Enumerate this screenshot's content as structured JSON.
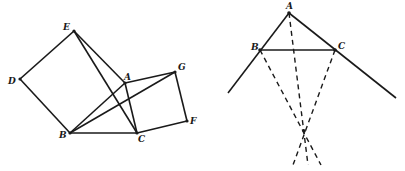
{
  "figures": {
    "left": {
      "points": {
        "A": {
          "label": "A",
          "x": 125,
          "y": 83
        },
        "B": {
          "label": "B",
          "x": 70,
          "y": 133
        },
        "C": {
          "label": "C",
          "x": 137,
          "y": 133
        },
        "D": {
          "label": "D",
          "x": 20,
          "y": 79
        },
        "E": {
          "label": "E",
          "x": 74,
          "y": 31
        },
        "F": {
          "label": "F",
          "x": 187,
          "y": 121
        },
        "G": {
          "label": "G",
          "x": 175,
          "y": 72
        }
      },
      "segments": [
        "DE",
        "EA",
        "DB",
        "BC",
        "AB",
        "AC",
        "EC",
        "BG",
        "AG",
        "GF",
        "FC"
      ]
    },
    "right": {
      "points": {
        "A": {
          "label": "A",
          "x": 289,
          "y": 13
        },
        "B": {
          "label": "B",
          "x": 260,
          "y": 50
        },
        "C": {
          "label": "C",
          "x": 335,
          "y": 50
        },
        "O": {
          "label": "",
          "x": 304,
          "y": 131
        }
      },
      "solid_segments": [
        "A-extended-left",
        "A-extended-right",
        "BC"
      ],
      "dashed_segments": [
        "A-O",
        "B-O",
        "C-O"
      ]
    }
  }
}
